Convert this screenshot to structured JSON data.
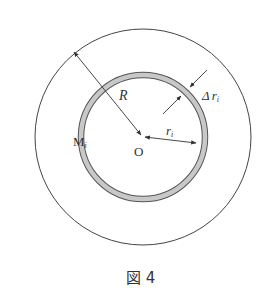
{
  "figure": {
    "caption": "図 4",
    "labels": {
      "outer_radius": "R",
      "ring_thickness_delta": "Δ",
      "ring_thickness_r": "r",
      "ring_thickness_sub": "i",
      "ring_radius": "r",
      "ring_radius_sub": "i",
      "center": "O",
      "mass_label": "M",
      "mass_sub": "i"
    },
    "colors": {
      "line": "#333333",
      "ring_fill": "#c8c8c8"
    }
  }
}
